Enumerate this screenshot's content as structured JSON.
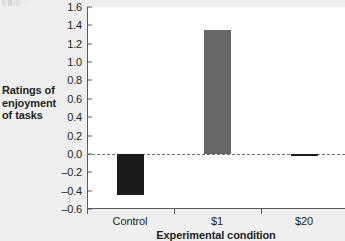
{
  "chart_data": {
    "type": "bar",
    "title": "",
    "xlabel": "Experimental condition",
    "ylabel": "Ratings of enjoyment of tasks",
    "categories": [
      "Control",
      "$1",
      "$20"
    ],
    "values": [
      -0.45,
      1.35,
      -0.02
    ],
    "ylim": [
      -0.6,
      1.6
    ],
    "yticks": [
      "1.6",
      "1.4",
      "1.2",
      "1.0",
      "0.8",
      "0.6",
      "0.4",
      "0.2",
      "0.0",
      "–0.2",
      "–0.4",
      "–0.6"
    ],
    "ytick_values": [
      1.6,
      1.4,
      1.2,
      1.0,
      0.8,
      0.6,
      0.4,
      0.2,
      0.0,
      -0.2,
      -0.4,
      -0.6
    ],
    "grid": false,
    "legend": "none",
    "zero_reference_line": true,
    "bar_colors": [
      "#1b1b1b",
      "#666666",
      "#1b1b1b"
    ],
    "plot_background": "#ffffff",
    "figure_background": "#efefef",
    "axis_color": "#58595b"
  },
  "ylabel_lines": [
    "Ratings of",
    "enjoyment",
    "of tasks"
  ]
}
